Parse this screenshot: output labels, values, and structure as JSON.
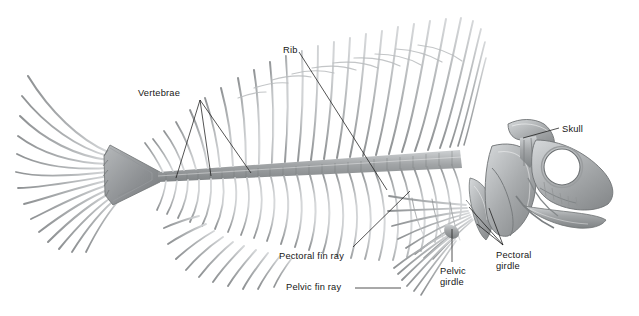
{
  "figure": {
    "background_color": "#ffffff",
    "bone_fill": "#9a9d9f",
    "bone_fill_light": "#c3c6c8",
    "bone_stroke": "#6f7375",
    "leader_color": "#1a1a1a",
    "text_color": "#161616"
  },
  "labels": [
    {
      "id": "vertebrae",
      "text": "Vertebrae",
      "x": 138,
      "y": 88,
      "lines": 1
    },
    {
      "id": "rib",
      "text": "Rib",
      "x": 283,
      "y": 45,
      "lines": 1
    },
    {
      "id": "skull",
      "text": "Skull",
      "x": 562,
      "y": 124,
      "lines": 1
    },
    {
      "id": "pectoral-fin-ray",
      "text": "Pectoral fin ray",
      "x": 279,
      "y": 251,
      "lines": 1
    },
    {
      "id": "pelvic-fin-ray",
      "text": "Pelvic fin ray",
      "x": 286,
      "y": 285,
      "lines": 1
    },
    {
      "id": "pectoral-girdle",
      "text": "Pectoral\ngirdle",
      "x": 496,
      "y": 252,
      "lines": 2
    },
    {
      "id": "pelvic-girdle",
      "text": "Pelvic\ngirdle",
      "x": 440,
      "y": 268,
      "lines": 2
    }
  ],
  "anatomy_parts": [
    "skull",
    "orbit",
    "operculum",
    "jaw",
    "vertebral-column",
    "neural-spines",
    "hemal-spines",
    "ribs",
    "dorsal-fin-rays",
    "anal-fin-rays",
    "caudal-fin-rays",
    "hypural-plate",
    "pectoral-girdle",
    "pectoral-fin-rays",
    "pelvic-girdle",
    "pelvic-fin-rays"
  ]
}
